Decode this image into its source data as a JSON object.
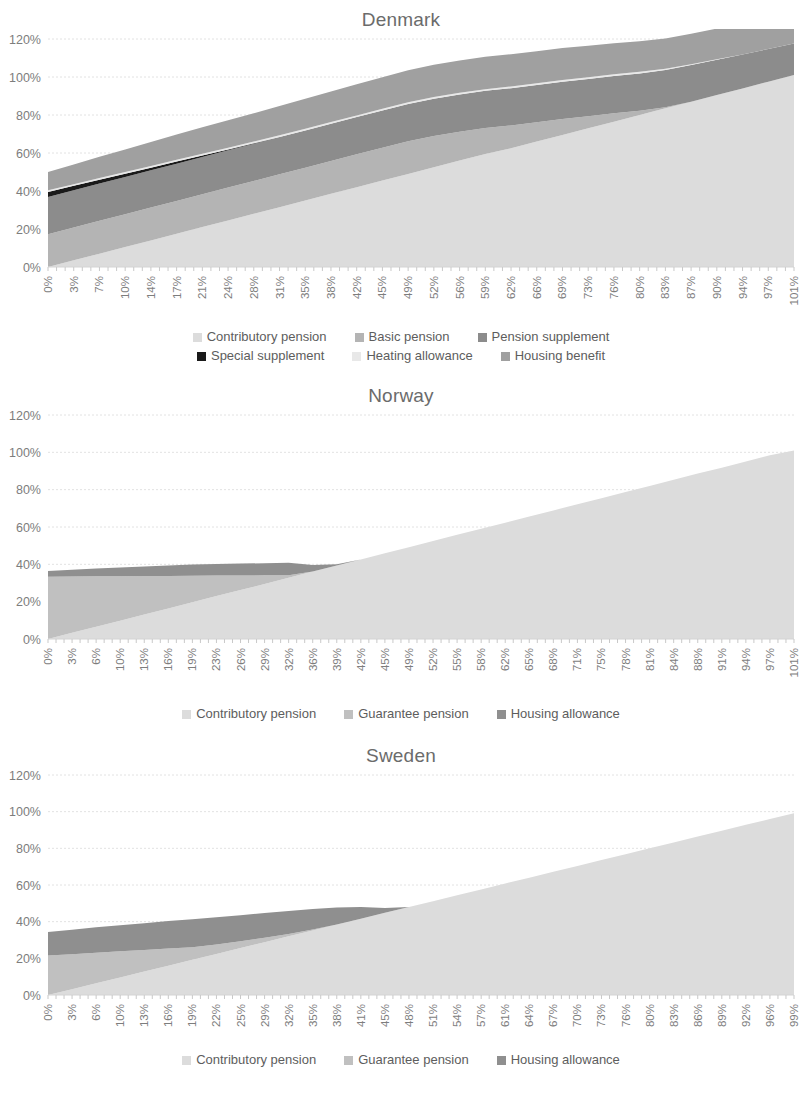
{
  "palette": {
    "contributory_pension": "#dcdcdc",
    "basic_pension": "#b4b4b4",
    "pension_supplement": "#8c8c8c",
    "special_supplement": "#1a1a1a",
    "heating_allowance": "#e8e8e8",
    "housing_benefit": "#a0a0a0",
    "guarantee_pension": "#c0c0c0",
    "housing_allowance": "#8f8f8f",
    "gridline": "#e2e2e2",
    "axis_text": "#7d7d7d",
    "title_text": "#6b6b6b"
  },
  "axis": {
    "y_ticks": [
      "0%",
      "20%",
      "40%",
      "60%",
      "80%",
      "100%",
      "120%"
    ],
    "y_min": 0,
    "y_max": 120
  },
  "charts": [
    {
      "id": "denmark",
      "title": "Denmark",
      "legend": [
        {
          "label": "Contributory pension",
          "color": "#dcdcdc"
        },
        {
          "label": "Basic pension",
          "color": "#b4b4b4"
        },
        {
          "label": "Pension supplement",
          "color": "#8c8c8c"
        },
        {
          "label": "Special supplement",
          "color": "#1a1a1a"
        },
        {
          "label": "Heating allowance",
          "color": "#e8e8e8"
        },
        {
          "label": "Housing benefit",
          "color": "#a0a0a0"
        }
      ],
      "legend_rows": [
        3,
        3
      ]
    },
    {
      "id": "norway",
      "title": "Norway",
      "legend": [
        {
          "label": "Contributory pension",
          "color": "#dcdcdc"
        },
        {
          "label": "Guarantee pension",
          "color": "#c0c0c0"
        },
        {
          "label": "Housing allowance",
          "color": "#8f8f8f"
        }
      ],
      "legend_rows": [
        3
      ]
    },
    {
      "id": "sweden",
      "title": "Sweden",
      "legend": [
        {
          "label": "Contributory pension",
          "color": "#dcdcdc"
        },
        {
          "label": "Guarantee pension",
          "color": "#c0c0c0"
        },
        {
          "label": "Housing allowance",
          "color": "#8f8f8f"
        }
      ],
      "legend_rows": [
        3
      ]
    }
  ],
  "chart_data": [
    {
      "type": "area",
      "stacked": true,
      "title": "Denmark",
      "xlabel": "",
      "ylabel": "",
      "ylim": [
        0,
        120
      ],
      "grid": true,
      "legend_position": "bottom",
      "categories": [
        "0%",
        "3%",
        "7%",
        "10%",
        "14%",
        "17%",
        "21%",
        "24%",
        "28%",
        "31%",
        "35%",
        "38%",
        "42%",
        "45%",
        "49%",
        "52%",
        "56%",
        "59%",
        "62%",
        "66%",
        "69%",
        "73%",
        "76%",
        "80%",
        "83%",
        "87%",
        "90%",
        "94%",
        "97%",
        "101%"
      ],
      "series": [
        {
          "name": "Contributory pension",
          "values": [
            0,
            3.5,
            7,
            10.5,
            14,
            17.5,
            21,
            24.5,
            28,
            31.5,
            35,
            38.5,
            42,
            45.5,
            49,
            52.5,
            56,
            59.5,
            62.5,
            66,
            69.5,
            73,
            76.5,
            80,
            83.5,
            87,
            90.5,
            94,
            97.5,
            101
          ]
        },
        {
          "name": "Basic pension",
          "values": [
            17.3,
            17.3,
            17.3,
            17.3,
            17.3,
            17.3,
            17.3,
            17.3,
            17.3,
            17.3,
            17.3,
            17.3,
            17.3,
            17.3,
            17.2,
            16.5,
            15.2,
            13.6,
            12.0,
            10.2,
            8.4,
            6.4,
            4.4,
            2.3,
            0.6,
            0,
            0,
            0,
            0,
            0
          ]
        },
        {
          "name": "Pension supplement",
          "values": [
            19.6,
            19.6,
            19.6,
            19.6,
            19.6,
            19.6,
            19.6,
            19.6,
            19.6,
            19.6,
            19.6,
            19.6,
            19.6,
            19.6,
            19.6,
            19.6,
            19.6,
            19.6,
            19.6,
            19.6,
            19.6,
            19.6,
            19.6,
            19.6,
            19.6,
            19.3,
            18.6,
            17.9,
            17.2,
            16.6
          ]
        },
        {
          "name": "Special supplement",
          "values": [
            2.6,
            2.3,
            2.0,
            1.7,
            1.4,
            1.1,
            0.8,
            0.5,
            0.2,
            0,
            0,
            0,
            0,
            0,
            0,
            0,
            0,
            0,
            0,
            0,
            0,
            0,
            0,
            0,
            0,
            0,
            0,
            0,
            0,
            0
          ]
        },
        {
          "name": "Heating allowance",
          "values": [
            0.9,
            0.9,
            0.9,
            0.9,
            0.9,
            0.9,
            0.9,
            0.9,
            0.9,
            0.9,
            0.9,
            0.9,
            0.9,
            0.9,
            0.9,
            0.9,
            0.9,
            0.9,
            0.9,
            0.9,
            0.9,
            0.9,
            0.9,
            0.8,
            0.6,
            0.4,
            0.2,
            0,
            0,
            0
          ]
        },
        {
          "name": "Housing benefit",
          "values": [
            9.6,
            10.4,
            11.2,
            11.9,
            12.6,
            13.3,
            13.9,
            14.4,
            14.9,
            15.4,
            15.8,
            16.1,
            16.4,
            16.6,
            16.8,
            16.9,
            17.0,
            17.0,
            17.0,
            16.9,
            16.8,
            16.6,
            16.4,
            16.1,
            16.0,
            16.0,
            16.2,
            16.7,
            17.3,
            17.9
          ]
        }
      ]
    },
    {
      "type": "area",
      "stacked": true,
      "title": "Norway",
      "xlabel": "",
      "ylabel": "",
      "ylim": [
        0,
        120
      ],
      "grid": true,
      "legend_position": "bottom",
      "categories": [
        "0%",
        "3%",
        "6%",
        "10%",
        "13%",
        "16%",
        "19%",
        "23%",
        "26%",
        "29%",
        "32%",
        "36%",
        "39%",
        "42%",
        "45%",
        "49%",
        "52%",
        "55%",
        "58%",
        "62%",
        "65%",
        "68%",
        "71%",
        "75%",
        "78%",
        "81%",
        "84%",
        "88%",
        "91%",
        "94%",
        "97%",
        "101%"
      ],
      "series": [
        {
          "name": "Contributory pension",
          "values": [
            0,
            3.3,
            6.6,
            9.8,
            13.1,
            16.4,
            19.7,
            23.0,
            26.2,
            29.5,
            32.8,
            36.1,
            39.4,
            42.6,
            45.9,
            49.2,
            52.5,
            55.8,
            59.0,
            62.3,
            65.6,
            68.9,
            72.2,
            75.4,
            78.7,
            82.0,
            85.3,
            88.6,
            91.8,
            95.1,
            98.4,
            101
          ]
        },
        {
          "name": "Guarantee pension",
          "values": [
            33.4,
            30.2,
            27.0,
            23.8,
            20.6,
            17.4,
            14.2,
            11.0,
            7.8,
            4.6,
            1.4,
            0,
            0,
            0,
            0,
            0,
            0,
            0,
            0,
            0,
            0,
            0,
            0,
            0,
            0,
            0,
            0,
            0,
            0,
            0,
            0,
            0
          ]
        },
        {
          "name": "Housing allowance",
          "values": [
            3.0,
            3.6,
            4.2,
            4.7,
            5.2,
            5.6,
            6.0,
            6.2,
            6.4,
            6.5,
            6.6,
            3.6,
            0.6,
            0,
            0,
            0,
            0,
            0,
            0,
            0,
            0,
            0,
            0,
            0,
            0,
            0,
            0,
            0,
            0,
            0,
            0,
            0
          ]
        }
      ]
    },
    {
      "type": "area",
      "stacked": true,
      "title": "Sweden",
      "xlabel": "",
      "ylabel": "",
      "ylim": [
        0,
        120
      ],
      "grid": true,
      "legend_position": "bottom",
      "categories": [
        "0%",
        "3%",
        "6%",
        "10%",
        "13%",
        "16%",
        "19%",
        "22%",
        "25%",
        "29%",
        "32%",
        "35%",
        "38%",
        "41%",
        "45%",
        "48%",
        "51%",
        "54%",
        "57%",
        "61%",
        "64%",
        "67%",
        "70%",
        "73%",
        "76%",
        "80%",
        "83%",
        "86%",
        "89%",
        "92%",
        "96%",
        "99%"
      ],
      "series": [
        {
          "name": "Contributory pension",
          "values": [
            0,
            3.2,
            6.4,
            9.6,
            12.8,
            16.0,
            19.2,
            22.4,
            25.6,
            28.8,
            32.0,
            35.2,
            38.4,
            41.6,
            44.8,
            48.0,
            51.2,
            54.4,
            57.6,
            60.8,
            64.0,
            67.2,
            70.4,
            73.6,
            76.8,
            80.0,
            83.2,
            86.4,
            89.6,
            92.8,
            96.0,
            99.2
          ]
        },
        {
          "name": "Guarantee pension",
          "values": [
            21.5,
            19.0,
            16.6,
            14.2,
            11.7,
            9.3,
            6.9,
            5.2,
            3.7,
            2.4,
            1.3,
            0.5,
            0,
            0,
            0,
            0,
            0,
            0,
            0,
            0,
            0,
            0,
            0,
            0,
            0,
            0,
            0,
            0,
            0,
            0,
            0,
            0
          ]
        },
        {
          "name": "Housing allowance",
          "values": [
            12.8,
            13.4,
            13.9,
            14.3,
            14.7,
            15.0,
            15.2,
            14.8,
            14.2,
            13.5,
            12.5,
            11.2,
            9.3,
            6.4,
            2.6,
            0,
            0,
            0,
            0,
            0,
            0,
            0,
            0,
            0,
            0,
            0,
            0,
            0,
            0,
            0,
            0,
            0
          ]
        }
      ]
    }
  ]
}
